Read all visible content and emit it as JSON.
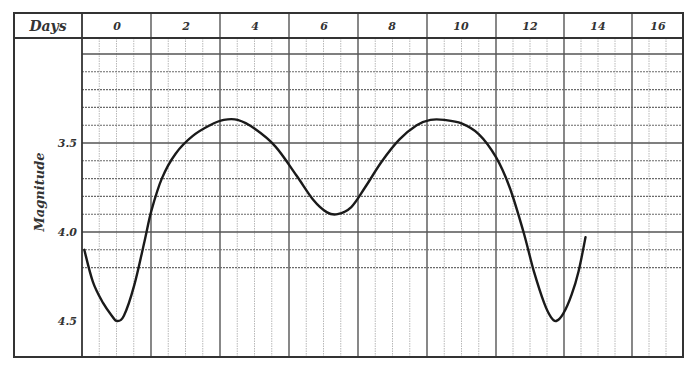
{
  "chart_data": {
    "type": "line",
    "title": "",
    "header_label": "Days",
    "xlabel": "Days",
    "ylabel": "Magnitude",
    "x_ticks": [
      "0",
      "2",
      "4",
      "6",
      "8",
      "10",
      "12",
      "14",
      "16"
    ],
    "y_ticks": [
      "3.5",
      "4.0",
      "4.5"
    ],
    "y_inverted": true,
    "xlim": [
      -1,
      16.5
    ],
    "ylim": [
      4.65,
      3.0
    ],
    "grid": true,
    "series": [
      {
        "name": "Light curve",
        "x": [
          -0.95,
          -0.7,
          -0.4,
          -0.15,
          0.0,
          0.2,
          0.5,
          0.8,
          1.0,
          1.3,
          1.7,
          2.2,
          2.7,
          3.1,
          3.5,
          4.0,
          4.6,
          5.2,
          5.7,
          6.1,
          6.4,
          6.8,
          7.2,
          7.7,
          8.2,
          8.7,
          9.1,
          9.5,
          10.0,
          10.5,
          11.0,
          11.4,
          11.8,
          12.1,
          12.4,
          12.6,
          12.75,
          12.95,
          13.2,
          13.4,
          13.6
        ],
        "values": [
          4.1,
          4.28,
          4.4,
          4.47,
          4.5,
          4.47,
          4.3,
          4.05,
          3.88,
          3.7,
          3.56,
          3.46,
          3.4,
          3.37,
          3.37,
          3.42,
          3.52,
          3.68,
          3.82,
          3.89,
          3.9,
          3.86,
          3.75,
          3.6,
          3.48,
          3.4,
          3.37,
          3.37,
          3.39,
          3.45,
          3.58,
          3.75,
          4.0,
          4.22,
          4.4,
          4.48,
          4.5,
          4.46,
          4.35,
          4.22,
          4.03
        ]
      }
    ]
  },
  "axes": {
    "header": "Days",
    "ylabel": "Magnitude",
    "x_ticks": [
      "0",
      "2",
      "4",
      "6",
      "8",
      "10",
      "12",
      "14",
      "16"
    ],
    "y_ticks": [
      "3.5",
      "4.0",
      "4.5"
    ]
  },
  "colors": {
    "curve": "#1a1a1a",
    "frame": "#333333",
    "major_grid": "#555555",
    "minor_grid": "#b0b0b0",
    "text": "#333333"
  }
}
